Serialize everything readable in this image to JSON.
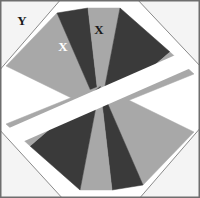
{
  "figure": {
    "canvas": {
      "width": 200,
      "height": 198
    },
    "colors": {
      "background": "#ffffff",
      "dark_wedge": "#3a3a3a",
      "light_wedge": "#a8a8a8",
      "corner_fill": "#f4f4f4",
      "outline": "#8a8a8a",
      "frame": "#6e6e6e",
      "label_light": "#ffffff",
      "label_dark": "#1a1a1a"
    },
    "labels": [
      {
        "id": "label-y-top-left",
        "text": "Y",
        "x": 22,
        "y": 22,
        "color": "#1a1a1a"
      },
      {
        "id": "label-x-dark-wedge",
        "text": "X",
        "x": 63,
        "y": 48,
        "color": "#ffffff"
      },
      {
        "id": "label-x-light-wedge",
        "text": "X",
        "x": 99,
        "y": 31,
        "color": "#1a1a1a"
      }
    ],
    "corner_triangles": [
      {
        "id": "corner-top-left",
        "label": "Y"
      },
      {
        "id": "corner-top-right",
        "label": ""
      },
      {
        "id": "corner-bottom-left",
        "label": ""
      },
      {
        "id": "corner-bottom-right",
        "label": ""
      }
    ],
    "wedges": {
      "top_group": [
        "dark",
        "light",
        "dark",
        "light"
      ],
      "bottom_group": [
        "dark",
        "light",
        "dark",
        "light"
      ]
    },
    "divider": {
      "orientation": "diagonal",
      "color": "#ffffff"
    }
  }
}
